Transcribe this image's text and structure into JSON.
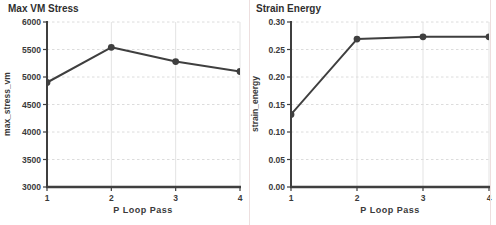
{
  "chart_data": [
    {
      "type": "line",
      "title": "Max VM Stress",
      "xlabel": "P Loop Pass",
      "ylabel": "max_stress_vm",
      "x": [
        1,
        2,
        3,
        4
      ],
      "values": [
        4900,
        5540,
        5280,
        5100
      ],
      "xlim": [
        1,
        4
      ],
      "ylim": [
        3000,
        6000
      ],
      "xtick_labels": [
        "1",
        "2",
        "3",
        "4"
      ],
      "ytick_values": [
        3000,
        3500,
        4000,
        4500,
        5000,
        5500,
        6000
      ],
      "ytick_labels": [
        "3000",
        "3500",
        "4000",
        "4500",
        "5000",
        "5500",
        "6000"
      ],
      "grid": true,
      "legend": "none",
      "marker": "circle"
    },
    {
      "type": "line",
      "title": "Strain Energy",
      "xlabel": "P Loop Pass",
      "ylabel": "strain_energy",
      "x": [
        1,
        2,
        3,
        4
      ],
      "values": [
        0.132,
        0.269,
        0.273,
        0.273
      ],
      "xlim": [
        1,
        4
      ],
      "ylim": [
        0,
        0.3
      ],
      "xtick_labels": [
        "1",
        "2",
        "3",
        "4"
      ],
      "ytick_values": [
        0,
        0.05,
        0.1,
        0.15,
        0.2,
        0.25,
        0.3
      ],
      "ytick_labels": [
        "0.00",
        "0.05",
        "0.10",
        "0.15",
        "0.20",
        "0.25",
        "0.30"
      ],
      "grid": true,
      "legend": "none",
      "marker": "circle"
    }
  ],
  "colors": {
    "line": "#3f3f3f",
    "marker": "#3f3f3f",
    "axis": "#3f3f3f",
    "grid_h": "#dcdcdc",
    "grid_v": "#e3e3e3",
    "text": "#3a3a3a",
    "background": "#ffffff",
    "divider": "#eddfdf"
  }
}
